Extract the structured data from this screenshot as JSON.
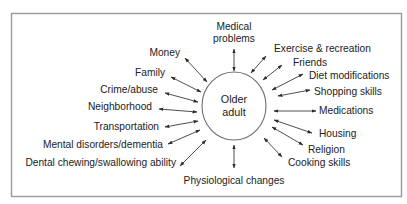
{
  "diagram": {
    "center": {
      "line1": "Older",
      "line2": "adult"
    },
    "factors": {
      "medical_problems": {
        "line1": "Medical",
        "line2": "problems"
      },
      "exercise": "Exercise & recreation",
      "friends": "Friends",
      "diet": "Diet modifications",
      "shopping": "Shopping skills",
      "medications": "Medications",
      "housing": "Housing",
      "religion": "Religion",
      "cooking": "Cooking skills",
      "physiological": "Physiological changes",
      "dental": "Dental chewing/swallowing ability",
      "mental": "Mental disorders/dementia",
      "transportation": "Transportation",
      "neighborhood": "Neighborhood",
      "crime": "Crime/abuse",
      "family": "Family",
      "money": "Money"
    },
    "colors": {
      "frame": "#9a9a9a",
      "line": "#3a3a3a",
      "text": "#222222"
    }
  }
}
